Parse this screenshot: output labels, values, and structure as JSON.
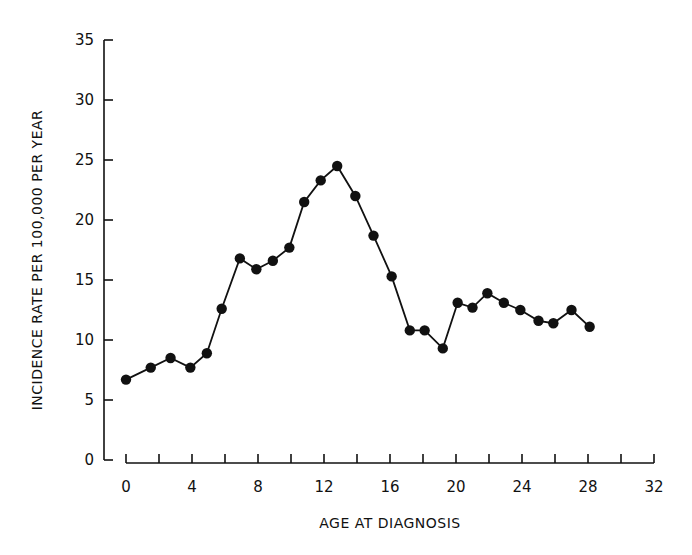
{
  "chart_data": {
    "type": "line",
    "title": "",
    "xlabel": "AGE AT DIAGNOSIS",
    "ylabel": "INCIDENCE RATE PER 100,000 PER YEAR",
    "xlim": [
      0,
      32
    ],
    "ylim": [
      0,
      35
    ],
    "x_ticks": [
      0,
      4,
      8,
      12,
      16,
      20,
      24,
      28,
      32
    ],
    "x_minor_ticks": [
      2,
      6,
      10,
      14,
      18,
      22,
      26,
      30
    ],
    "y_ticks": [
      0,
      5,
      10,
      15,
      20,
      25,
      30,
      35
    ],
    "grid": false,
    "legend": null,
    "marker": "filled-circle",
    "series": [
      {
        "name": "Incidence rate",
        "x": [
          0,
          1.5,
          2.7,
          3.9,
          4.9,
          5.8,
          6.9,
          7.9,
          8.9,
          9.9,
          10.8,
          11.8,
          12.8,
          13.9,
          15.0,
          16.1,
          17.2,
          18.1,
          19.2,
          20.1,
          21.0,
          21.9,
          22.9,
          23.9,
          25.0,
          25.9,
          27.0,
          28.1
        ],
        "values": [
          6.7,
          7.7,
          8.5,
          7.7,
          8.9,
          12.6,
          16.8,
          15.9,
          16.6,
          17.7,
          21.5,
          23.3,
          24.5,
          22.0,
          18.7,
          15.3,
          10.8,
          10.8,
          9.3,
          13.1,
          12.7,
          13.9,
          13.1,
          12.5,
          11.6,
          11.4,
          12.5,
          11.1
        ]
      }
    ]
  },
  "colors": {
    "line": "#111111",
    "marker": "#111111",
    "axis": "#111111",
    "background": "#ffffff"
  }
}
